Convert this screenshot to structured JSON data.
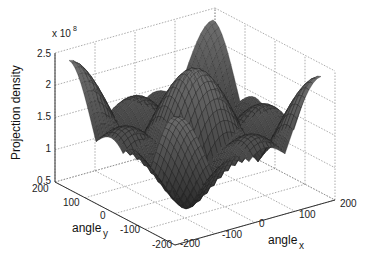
{
  "chart_data": {
    "type": "surface3d",
    "title": "",
    "zlabel": "Projection density",
    "z_exponent_label": "x 10",
    "z_exponent": "8",
    "xlabel": "angle",
    "xlabel_sub": "x",
    "ylabel": "angle",
    "ylabel_sub": "y",
    "xlim": [
      -200,
      200
    ],
    "ylim": [
      -200,
      200
    ],
    "zlim": [
      0.5,
      2.5
    ],
    "x_ticks": [
      "-200",
      "-100",
      "0",
      "100",
      "200"
    ],
    "y_ticks": [
      "200",
      "100",
      "0",
      "-100",
      "-200"
    ],
    "z_ticks": [
      "0.5",
      "1",
      "1.5",
      "2",
      "2.5"
    ],
    "grid": true,
    "colormap": "gray",
    "peak_max": 2.4,
    "min_value": 0.6
  },
  "axes": {
    "z_tick_labels": [
      "2.5",
      "2",
      "1.5",
      "1",
      "0.5"
    ],
    "y_tick_labels": [
      "200",
      "100",
      "0",
      "-100",
      "-200"
    ],
    "x_tick_labels": [
      "-200",
      "-100",
      "0",
      "100",
      "200"
    ]
  }
}
